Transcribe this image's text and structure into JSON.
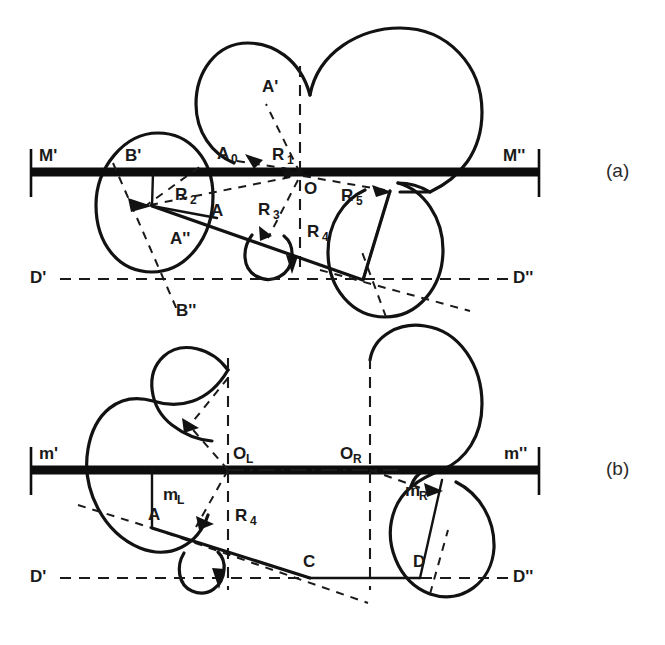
{
  "figure": {
    "panels": [
      {
        "tag": "(a)",
        "labels": {
          "axis_left": "M'",
          "axis_right": "M''",
          "datum_left": "D'",
          "datum_right": "D''",
          "point_b_prime": "B'",
          "point_b_double": "B''",
          "point_a_prime": "A'",
          "point_a_double": "A''",
          "point_a": "A",
          "point_a_zero": "A",
          "point_a_zero_sub": "0",
          "center_o": "O",
          "r1": "R",
          "r1_sub": "1",
          "r2": "R",
          "r2_sub": "2",
          "r3": "R",
          "r3_sub": "3",
          "r4": "R",
          "r4_sub": "4",
          "r5": "R",
          "r5_sub": "5"
        }
      },
      {
        "tag": "(b)",
        "labels": {
          "axis_left": "m'",
          "axis_right": "m''",
          "datum_left": "D'",
          "datum_right": "D''",
          "center_left": "O",
          "center_left_sub": "L",
          "center_right": "O",
          "center_right_sub": "R",
          "m_left": "m",
          "m_left_sub": "L",
          "m_right": "m",
          "m_right_sub": "R",
          "point_a": "A",
          "point_c": "C",
          "point_d": "D",
          "r4": "R",
          "r4_sub": "4"
        }
      }
    ],
    "colors": {
      "ink": "#121212",
      "background": "#ffffff",
      "bar": "#0d0d0d"
    }
  }
}
